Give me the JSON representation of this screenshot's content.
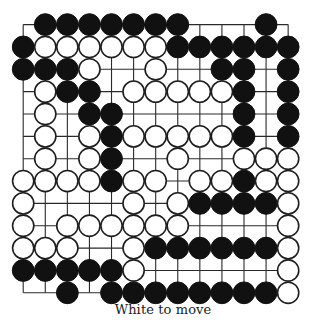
{
  "puzzle": {
    "caption": "White to move",
    "to_move": "white",
    "board_size": 13,
    "legend": {
      "B": "black-stone",
      "W": "white-stone",
      ".": "empty-intersection"
    },
    "board_rows": [
      ".BBBBBBB...B.",
      "BWWWWWWBBBBBB",
      "BBBW..W..BB.B",
      ".WBB.WWWWWB.B",
      ".W.BB.....B.B",
      ".W.WBWWWWWB.B",
      ".W.WB..W..WWW",
      "WWWWBWW.WWBWW",
      "W....W.WBBBBW",
      "W.WWWWWW....W",
      "WWW..WBBBBBBW",
      "BBBBBW......W",
      "..B.BBBBBBBBW"
    ],
    "colors": {
      "black_stone": "#111111",
      "white_stone_fill": "#ffffff",
      "white_stone_outline": "#1e1e1e",
      "grid": "#2a2a2a",
      "background": "#ffffff"
    }
  }
}
